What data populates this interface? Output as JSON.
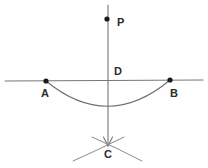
{
  "figure": {
    "background_color": "#ffffff",
    "line_color": "#777777",
    "point_color": "#1a1a1a",
    "label_color": "#2b2b2b",
    "width": 208,
    "height": 168
  },
  "labels": {
    "p": "P",
    "d": "D",
    "a": "A",
    "b": "B",
    "c": "C"
  },
  "points": [
    {
      "name": "P",
      "label": "P",
      "x": 107,
      "y": 19,
      "marked": true
    },
    {
      "name": "D",
      "label": "D",
      "x": 108,
      "y": 81,
      "marked": false
    },
    {
      "name": "A",
      "label": "A",
      "x": 46,
      "y": 81,
      "marked": true
    },
    {
      "name": "B",
      "label": "B",
      "x": 170,
      "y": 80,
      "marked": true
    },
    {
      "name": "C",
      "label": "C",
      "x": 108,
      "y": 145,
      "marked": false
    }
  ],
  "label_positions": {
    "p": {
      "x": 117,
      "y": 17
    },
    "d": {
      "x": 114,
      "y": 66
    },
    "a": {
      "x": 41,
      "y": 88
    },
    "b": {
      "x": 170,
      "y": 88
    },
    "c": {
      "x": 104,
      "y": 149
    }
  },
  "geometry": {
    "horizontal_line": {
      "x1": 5,
      "y1": 81,
      "x2": 203,
      "y2": 80
    },
    "vertical_line": {
      "x1": 108,
      "y1": 5,
      "x2": 108,
      "y2": 146
    },
    "vertical_arrow": "down",
    "main_arc": {
      "start_x": 46,
      "start_y": 81,
      "end_x": 170,
      "end_y": 80,
      "lowest_y": 110
    },
    "cross_arc_left": {
      "start_x": 73,
      "start_y": 161,
      "end_x": 124,
      "end_y": 137
    },
    "cross_arc_right": {
      "start_x": 92,
      "start_y": 137,
      "end_x": 142,
      "end_y": 161
    }
  }
}
